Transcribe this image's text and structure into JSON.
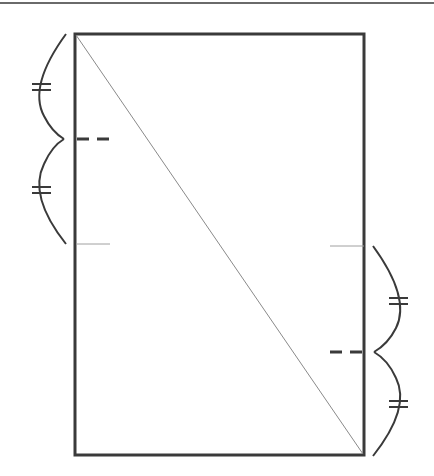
{
  "figure": {
    "colors": {
      "stroke_dark": "#3a3a3a",
      "stroke_light": "#9a9a9a",
      "background": "#ffffff"
    },
    "top_rule": {
      "y": 3,
      "x1": 0,
      "x2": 434
    },
    "rectangle": {
      "x": 75,
      "y": 34,
      "width": 289,
      "height": 421
    },
    "diagonal": {
      "x1": 75,
      "y1": 34,
      "x2": 364,
      "y2": 455
    },
    "left_side": {
      "segment_top": 34,
      "segment_bottom": 244,
      "midpoint_y": 139,
      "midpoint_dash": {
        "x1": 77,
        "x2": 111,
        "y": 139
      },
      "division_line": {
        "x1": 76,
        "x2": 110,
        "y": 244
      },
      "equal_marks": [
        "≠",
        "≠"
      ]
    },
    "right_side": {
      "segment_top": 246,
      "segment_bottom": 455,
      "midpoint_y": 352,
      "midpoint_dash": {
        "x1": 330,
        "x2": 363,
        "y": 352
      },
      "division_line": {
        "x1": 330,
        "x2": 364,
        "y": 246
      },
      "equal_marks": [
        "≠",
        "≠"
      ]
    }
  }
}
